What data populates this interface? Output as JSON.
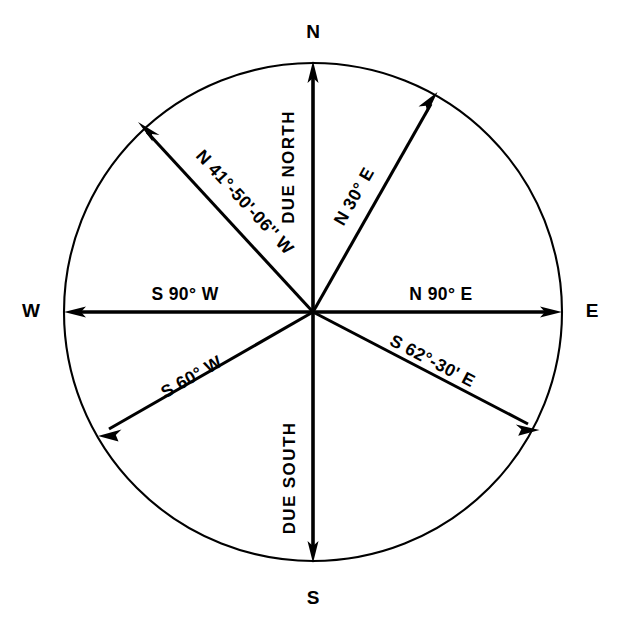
{
  "figure": {
    "shape": "circle",
    "stroke_color": "#000000",
    "background_color": "#ffffff"
  },
  "cardinals": {
    "north": "N",
    "east": "E",
    "south": "S",
    "west": "W"
  },
  "bearings": [
    {
      "id": "due-north",
      "label": "DUE NORTH",
      "direction": "N",
      "azimuth_deg": 0
    },
    {
      "id": "n-30-e",
      "label": "N 30° E",
      "direction": "NE",
      "azimuth_deg": 30
    },
    {
      "id": "n-90-e",
      "label": "N 90° E",
      "direction": "E",
      "azimuth_deg": 90
    },
    {
      "id": "s-62-30-e",
      "label": "S 62°-30' E",
      "direction": "SE",
      "azimuth_deg": 117.5
    },
    {
      "id": "due-south",
      "label": "DUE SOUTH",
      "direction": "S",
      "azimuth_deg": 180
    },
    {
      "id": "s-60-w",
      "label": "S 60° W",
      "direction": "SW",
      "azimuth_deg": 240
    },
    {
      "id": "s-90-w",
      "label": "S 90° W",
      "direction": "W",
      "azimuth_deg": 270
    },
    {
      "id": "n-41-50-06-w",
      "label": "N 41°-50'-06'' W",
      "direction": "NW",
      "azimuth_deg": 318.165
    }
  ]
}
